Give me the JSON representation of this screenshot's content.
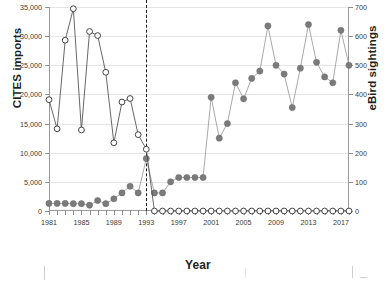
{
  "axes": {
    "xlabel": "Year",
    "ylabel_left": "CITES imports",
    "ylabel_right": "eBird sightings",
    "yticks_left": [
      "0",
      "5,000",
      "10,000",
      "15,000",
      "20,000",
      "25,000",
      "30,000",
      "35,000"
    ],
    "yticks_right": [
      "0",
      "100",
      "200",
      "300",
      "400",
      "500",
      "600",
      "700"
    ],
    "xticks": [
      "1981",
      "1985",
      "1989",
      "1993",
      "1997",
      "2001",
      "2005",
      "2009",
      "2013",
      "2017"
    ]
  },
  "annotations": {
    "divider_year": 1993
  },
  "chart_data": {
    "type": "line",
    "title": "",
    "xlabel": "Year",
    "grid": true,
    "legend": "none",
    "x": [
      1981,
      1982,
      1983,
      1984,
      1985,
      1986,
      1987,
      1988,
      1989,
      1990,
      1991,
      1992,
      1993,
      1994,
      1995,
      1996,
      1997,
      1998,
      1999,
      2000,
      2001,
      2002,
      2003,
      2004,
      2005,
      2006,
      2007,
      2008,
      2009,
      2010,
      2011,
      2012,
      2013,
      2014,
      2015,
      2016,
      2017,
      2018
    ],
    "series": [
      {
        "name": "CITES imports",
        "axis": "left",
        "ylabel": "CITES imports",
        "ylim": [
          0,
          35000
        ],
        "marker": "open-circle",
        "values": [
          19100,
          14100,
          29300,
          34700,
          13900,
          30800,
          30100,
          23800,
          11700,
          18700,
          19300,
          13100,
          10600,
          0,
          0,
          0,
          0,
          0,
          0,
          0,
          0,
          0,
          0,
          0,
          0,
          0,
          0,
          0,
          0,
          0,
          0,
          0,
          0,
          0,
          0,
          0,
          0,
          0
        ]
      },
      {
        "name": "eBird sightings",
        "axis": "right",
        "ylabel": "eBird sightings",
        "ylim": [
          0,
          700
        ],
        "marker": "filled-circle",
        "values": [
          26,
          26,
          26,
          25,
          25,
          20,
          36,
          25,
          42,
          62,
          85,
          62,
          180,
          62,
          62,
          100,
          115,
          115,
          115,
          115,
          390,
          250,
          300,
          440,
          385,
          455,
          480,
          635,
          500,
          470,
          355,
          490,
          640,
          510,
          460,
          440,
          620,
          500
        ]
      }
    ]
  }
}
